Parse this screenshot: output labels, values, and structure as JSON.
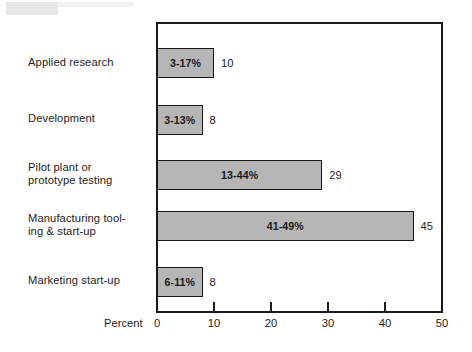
{
  "chart_data": {
    "type": "bar",
    "orientation": "horizontal",
    "title": "",
    "xlabel": "Percent",
    "ylabel": "",
    "xlim": [
      0,
      50
    ],
    "xticks": [
      0,
      10,
      20,
      30,
      40,
      50
    ],
    "xtick_labels": [
      "0",
      "10",
      "20",
      "30",
      "40",
      "50"
    ],
    "grid": false,
    "legend": "none",
    "categories": [
      "Applied research",
      "Development",
      "Pilot plant or prototype testing",
      "Manufacturing tooling & start-up",
      "Marketing start-up"
    ],
    "values": [
      10,
      8,
      29,
      45,
      8
    ],
    "value_labels": [
      "10",
      "8",
      "29",
      "45",
      "8"
    ],
    "range_labels": [
      "3-17%",
      "3-13%",
      "13-44%",
      "41-49%",
      "6-11%"
    ],
    "ranges": [
      {
        "low": 3,
        "high": 17
      },
      {
        "low": 3,
        "high": 13
      },
      {
        "low": 13,
        "high": 44
      },
      {
        "low": 41,
        "high": 49
      },
      {
        "low": 6,
        "high": 11
      }
    ],
    "bar_fill_color": "#b6b6b6",
    "bar_edge_color": "#161616",
    "background_color": "#ffffff"
  },
  "rows": [
    {
      "label_line1": "Applied research",
      "label_line2": "",
      "range_label": "3-17%",
      "value_label": "10",
      "value": 10
    },
    {
      "label_line1": "Development",
      "label_line2": "",
      "range_label": "3-13%",
      "value_label": "8",
      "value": 8
    },
    {
      "label_line1": "Pilot plant or",
      "label_line2": "prototype testing",
      "range_label": "13-44%",
      "value_label": "29",
      "value": 29
    },
    {
      "label_line1": "Manufacturing tool-",
      "label_line2": "ing & start-up",
      "range_label": "41-49%",
      "value_label": "45",
      "value": 45
    },
    {
      "label_line1": "Marketing start-up",
      "label_line2": "",
      "range_label": "6-11%",
      "value_label": "8",
      "value": 8
    }
  ],
  "axis": {
    "title": "Percent",
    "ticks": [
      {
        "label": "0"
      },
      {
        "label": "10"
      },
      {
        "label": "20"
      },
      {
        "label": "30"
      },
      {
        "label": "40"
      },
      {
        "label": "50"
      }
    ]
  }
}
